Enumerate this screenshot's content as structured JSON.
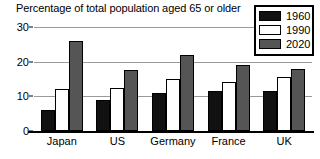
{
  "chart_data": {
    "type": "bar",
    "title": "Percentage of total population aged 65 or older",
    "xlabel": "",
    "ylabel": "",
    "ylim": [
      0,
      30
    ],
    "yticks": [
      0,
      10,
      20,
      30
    ],
    "grid": true,
    "legend_position": "top-right",
    "categories": [
      "Japan",
      "US",
      "Germany",
      "France",
      "UK"
    ],
    "series": [
      {
        "name": "1960",
        "color": "#111111",
        "values": [
          6,
          9,
          11,
          11.5,
          11.5
        ]
      },
      {
        "name": "1990",
        "color": "#ffffff",
        "values": [
          12,
          12.5,
          15,
          14,
          15.5
        ]
      },
      {
        "name": "2020",
        "color": "#555555",
        "values": [
          26,
          17.5,
          22,
          19,
          18
        ]
      }
    ]
  },
  "legend": {
    "items": [
      {
        "label": "1960"
      },
      {
        "label": "1990"
      },
      {
        "label": "2020"
      }
    ]
  },
  "axis": {
    "yticks": [
      {
        "label": "30"
      },
      {
        "label": "20"
      },
      {
        "label": "10"
      },
      {
        "label": "0"
      }
    ]
  }
}
